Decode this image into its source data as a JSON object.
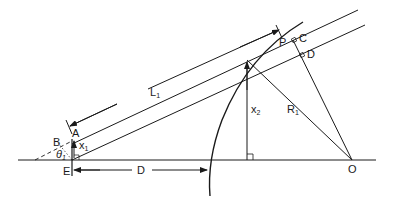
{
  "diagram": {
    "type": "geometry-construction",
    "colors": {
      "line": "#1a1a1a",
      "background": "#ffffff"
    },
    "labels": {
      "P": "P",
      "C": "C",
      "D_point": "D",
      "A": "A",
      "B": "B",
      "E": "E",
      "O": "O",
      "theta": "θ",
      "theta_sub": "1",
      "L": "L",
      "L_sub": "1",
      "x1": "x",
      "x1_sub": "1",
      "x2": "x",
      "x2_sub": "2",
      "R": "R",
      "R_sub": "1",
      "D_distance": "D"
    }
  }
}
